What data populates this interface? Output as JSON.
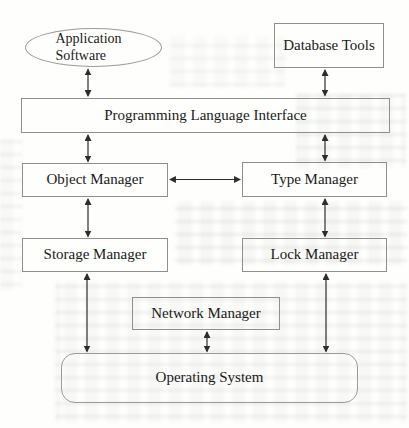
{
  "diagram": {
    "nodes": {
      "application_software": {
        "label": "Application Software",
        "shape": "ellipse"
      },
      "database_tools": {
        "label": "Database Tools",
        "shape": "rect"
      },
      "programming_language_interface": {
        "label": "Programming Language Interface",
        "shape": "rect"
      },
      "object_manager": {
        "label": "Object Manager",
        "shape": "rect"
      },
      "type_manager": {
        "label": "Type Manager",
        "shape": "rect"
      },
      "storage_manager": {
        "label": "Storage Manager",
        "shape": "rect"
      },
      "lock_manager": {
        "label": "Lock Manager",
        "shape": "rect"
      },
      "network_manager": {
        "label": "Network Manager",
        "shape": "rect"
      },
      "operating_system": {
        "label": "Operating System",
        "shape": "rounded-rect"
      }
    },
    "edges": [
      {
        "from": "application_software",
        "to": "programming_language_interface",
        "style": "double-arrow"
      },
      {
        "from": "database_tools",
        "to": "programming_language_interface",
        "style": "double-arrow"
      },
      {
        "from": "programming_language_interface",
        "to": "object_manager",
        "style": "double-arrow"
      },
      {
        "from": "programming_language_interface",
        "to": "type_manager",
        "style": "double-arrow"
      },
      {
        "from": "object_manager",
        "to": "type_manager",
        "style": "double-arrow"
      },
      {
        "from": "object_manager",
        "to": "storage_manager",
        "style": "double-arrow"
      },
      {
        "from": "type_manager",
        "to": "lock_manager",
        "style": "double-arrow"
      },
      {
        "from": "storage_manager",
        "to": "operating_system",
        "style": "double-arrow"
      },
      {
        "from": "lock_manager",
        "to": "operating_system",
        "style": "double-arrow"
      },
      {
        "from": "network_manager",
        "to": "operating_system",
        "style": "double-arrow"
      }
    ],
    "colors": {
      "line": "#2d2d2d",
      "box_border": "#8f8f8f",
      "text": "#1a1a1a",
      "background": "#fefefd"
    }
  }
}
